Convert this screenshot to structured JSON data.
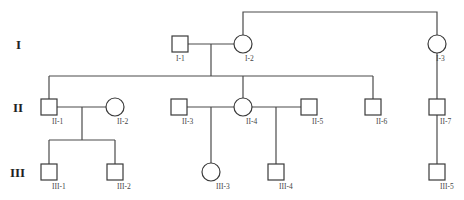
{
  "diagram": {
    "type": "pedigree",
    "generations": [
      {
        "label": "I",
        "x": 16,
        "y": 49
      },
      {
        "label": "II",
        "x": 14,
        "y": 112
      },
      {
        "label": "III",
        "x": 11,
        "y": 177
      }
    ],
    "individuals": [
      {
        "id": "I-1",
        "sex": "male",
        "cx": 180,
        "cy": 44,
        "lx": 176,
        "ly": 61
      },
      {
        "id": "I-2",
        "sex": "female",
        "cx": 243,
        "cy": 44,
        "lx": 246,
        "ly": 61
      },
      {
        "id": "I-3",
        "sex": "female",
        "cx": 437,
        "cy": 44,
        "lx": 438,
        "ly": 61
      },
      {
        "id": "II-1",
        "sex": "male",
        "cx": 49,
        "cy": 107,
        "lx": 51,
        "ly": 124
      },
      {
        "id": "II-2",
        "sex": "female",
        "cx": 115,
        "cy": 107,
        "lx": 117,
        "ly": 124
      },
      {
        "id": "II-3",
        "sex": "male",
        "cx": 179,
        "cy": 107,
        "lx": 181,
        "ly": 124
      },
      {
        "id": "II-4",
        "sex": "female",
        "cx": 243,
        "cy": 107,
        "lx": 245,
        "ly": 124
      },
      {
        "id": "II-5",
        "sex": "male",
        "cx": 309,
        "cy": 107,
        "lx": 311,
        "ly": 124
      },
      {
        "id": "II-6",
        "sex": "male",
        "cx": 373,
        "cy": 107,
        "lx": 375,
        "ly": 124
      },
      {
        "id": "II-7",
        "sex": "male",
        "cx": 437,
        "cy": 107,
        "lx": 439,
        "ly": 124
      },
      {
        "id": "III-1",
        "sex": "male",
        "cx": 49,
        "cy": 172,
        "lx": 52,
        "ly": 189
      },
      {
        "id": "III-2",
        "sex": "male",
        "cx": 115,
        "cy": 172,
        "lx": 117,
        "ly": 189
      },
      {
        "id": "III-3",
        "sex": "female",
        "cx": 211,
        "cy": 172,
        "lx": 215,
        "ly": 189
      },
      {
        "id": "III-4",
        "sex": "male",
        "cx": 276,
        "cy": 172,
        "lx": 279,
        "ly": 189
      },
      {
        "id": "III-5",
        "sex": "male",
        "cx": 437,
        "cy": 172,
        "lx": 439,
        "ly": 189
      }
    ],
    "relationships": [
      {
        "type": "mating",
        "partners": [
          "I-1",
          "I-2"
        ],
        "children": [
          "II-1",
          "II-3",
          "II-4",
          "II-6"
        ]
      },
      {
        "type": "parent-child",
        "parent": "I-2",
        "relation": "sibling-link",
        "with": "I-3"
      },
      {
        "type": "parent-child",
        "parent": "I-3",
        "children": [
          "II-7"
        ]
      },
      {
        "type": "mating",
        "partners": [
          "II-1",
          "II-2"
        ],
        "children": [
          "III-1",
          "III-2"
        ]
      },
      {
        "type": "mating",
        "partners": [
          "II-3",
          "II-4"
        ],
        "children": [
          "III-3"
        ]
      },
      {
        "type": "mating",
        "partners": [
          "II-4",
          "II-5"
        ],
        "children": [
          "III-4"
        ]
      },
      {
        "type": "parent-child",
        "parent": "II-7",
        "children": [
          "III-5"
        ]
      }
    ],
    "colors": {
      "line": "#4a4a4a",
      "shape_fill": "#ffffff",
      "text": "#222222"
    }
  }
}
